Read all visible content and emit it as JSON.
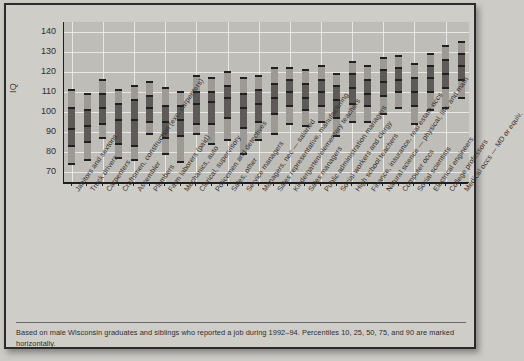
{
  "figure": {
    "note": "Based on male Wisconsin graduates and siblings who reported a job during 1992–94. Percentiles 10, 25, 50, 75, and 90 are marked horizontally."
  },
  "chart_data": {
    "type": "bar",
    "title": "",
    "xlabel": "",
    "ylabel": "IQ",
    "ylim": [
      65,
      145
    ],
    "yticks": [
      70,
      80,
      90,
      100,
      110,
      120,
      130,
      140
    ],
    "grid": true,
    "legend_position": "none",
    "percentiles": [
      10,
      25,
      50,
      75,
      90
    ],
    "categories": [
      "Janitors and sextons",
      "Truck drivers",
      "Carpenters",
      "Craftsmen, construction (exc. carpenters)",
      "Assembler",
      "Plumbers",
      "Farm laborers (paid)",
      "Mechanics, auto",
      "Clerical, supervisory",
      "Policemen and detectives",
      "Sales, other",
      "Service managers",
      "Managers, nec — salaried",
      "Sales representative, manufacturing",
      "Kindergarten/elementary teachers",
      "Sales managers",
      "Public administration managers",
      "Social workers and clergy",
      "High school teachers",
      "Finance, insurance, real estate occs",
      "Natural science — physical, life, and math",
      "Computer occs",
      "Social scientists",
      "Electrical engineers",
      "College professors",
      "Medical occs — MD or equiv."
    ],
    "series": [
      {
        "name": "p10",
        "values": [
          74,
          76,
          87,
          77,
          76,
          89,
          79,
          75,
          89,
          84,
          86,
          79,
          86,
          89,
          94,
          93,
          95,
          88,
          95,
          95,
          99,
          102,
          94,
          101,
          102,
          107
        ]
      },
      {
        "name": "p25",
        "values": [
          83,
          85,
          94,
          84,
          83,
          95,
          87,
          88,
          94,
          94,
          97,
          92,
          95,
          99,
          103,
          101,
          103,
          97,
          104,
          103,
          108,
          110,
          103,
          110,
          112,
          116
        ]
      },
      {
        "name": "p50",
        "values": [
          91.5,
          93,
          102,
          96,
          96,
          102,
          95,
          96,
          104,
          105,
          107,
          102,
          104,
          107,
          110,
          107,
          110,
          106,
          112,
          109,
          115,
          116,
          110,
          117,
          119,
          123
        ]
      },
      {
        "name": "p75",
        "values": [
          102,
          101,
          109,
          104,
          106,
          108,
          103,
          103,
          110,
          110,
          113,
          109,
          111,
          114,
          116,
          114,
          116,
          113,
          119,
          116,
          121,
          122,
          117,
          123,
          126,
          129
        ]
      },
      {
        "name": "p90",
        "values": [
          111,
          109,
          116,
          111,
          113,
          115,
          112,
          110,
          118,
          117,
          120,
          117,
          118,
          122,
          122,
          121,
          123,
          119,
          125,
          123,
          127,
          128,
          124,
          129,
          133,
          135
        ]
      }
    ]
  }
}
